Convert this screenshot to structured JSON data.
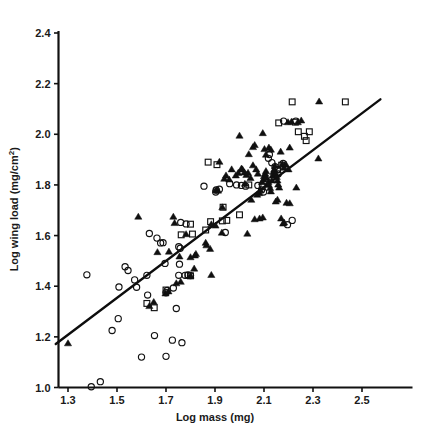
{
  "chart_data": {
    "type": "scatter",
    "title": "",
    "xlabel": "Log mass (mg)",
    "ylabel_main": "Log wing load (mg/cm",
    "ylabel_sup": "2",
    "ylabel_tail": ")",
    "ylabel_full": "Log wing load (mg/cm2)",
    "xlim": [
      1.25,
      2.58
    ],
    "ylim": [
      1.0,
      2.4
    ],
    "xticks": [
      "1.3",
      "1.5",
      "1.7",
      "1.9",
      "2.1",
      "2.3",
      "2.5"
    ],
    "xtick_values": [
      1.3,
      1.5,
      1.7,
      1.9,
      2.1,
      2.3,
      2.5
    ],
    "yticks": [
      "1.0",
      "1.2",
      "1.4",
      "1.6",
      "1.8",
      "2.0",
      "2.2",
      "2.4"
    ],
    "ytick_values": [
      1.0,
      1.2,
      1.4,
      1.6,
      1.8,
      2.0,
      2.2,
      2.4
    ],
    "grid": false,
    "legend": "none",
    "marker_colors": {
      "open_circle": "#121212",
      "open_square": "#121212",
      "filled_triangle": "#101010",
      "fit_line": "#0d0d0d"
    },
    "fit_line": {
      "x_start": 1.25,
      "y_start": 1.172,
      "x_end": 2.575,
      "y_end": 2.138,
      "slope": 0.744
    },
    "series": [
      {
        "name": "open circle",
        "marker": "open-circle",
        "points": [
          [
            1.395,
            1.003
          ],
          [
            1.432,
            1.023
          ],
          [
            1.6,
            1.12
          ],
          [
            1.7,
            1.123
          ],
          [
            1.653,
            1.205
          ],
          [
            1.726,
            1.187
          ],
          [
            1.765,
            1.177
          ],
          [
            1.48,
            1.225
          ],
          [
            1.505,
            1.272
          ],
          [
            1.533,
            1.477
          ],
          [
            1.545,
            1.462
          ],
          [
            1.572,
            1.425
          ],
          [
            1.58,
            1.396
          ],
          [
            1.508,
            1.397
          ],
          [
            1.377,
            1.445
          ],
          [
            1.622,
            1.443
          ],
          [
            1.625,
            1.365
          ],
          [
            1.752,
            1.443
          ],
          [
            1.778,
            1.443
          ],
          [
            1.7,
            1.374
          ],
          [
            1.705,
            1.383
          ],
          [
            1.73,
            1.393
          ],
          [
            1.742,
            1.312
          ],
          [
            1.696,
            1.49
          ],
          [
            1.755,
            1.487
          ],
          [
            1.632,
            1.608
          ],
          [
            1.663,
            1.59
          ],
          [
            1.678,
            1.571
          ],
          [
            1.688,
            1.572
          ],
          [
            1.752,
            1.556
          ],
          [
            1.758,
            1.55
          ],
          [
            1.79,
            1.445
          ],
          [
            1.8,
            1.442
          ],
          [
            1.782,
            1.646
          ],
          [
            1.76,
            1.652
          ],
          [
            1.855,
            1.795
          ],
          [
            1.905,
            1.78
          ],
          [
            1.918,
            1.783
          ],
          [
            1.96,
            1.805
          ],
          [
            1.942,
            1.612
          ],
          [
            1.988,
            1.8
          ],
          [
            2.008,
            1.798
          ],
          [
            2.025,
            1.795
          ],
          [
            2.075,
            1.798
          ],
          [
            2.09,
            1.78
          ],
          [
            2.098,
            1.772
          ],
          [
            2.118,
            1.905
          ],
          [
            2.122,
            1.92
          ],
          [
            2.132,
            1.888
          ],
          [
            2.145,
            1.872
          ],
          [
            2.155,
            1.86
          ],
          [
            2.158,
            1.843
          ],
          [
            2.178,
            1.885
          ],
          [
            2.18,
            2.052
          ],
          [
            2.23,
            2.052
          ],
          [
            2.196,
            1.643
          ],
          [
            2.215,
            1.66
          ],
          [
            1.903,
            1.772
          ]
        ]
      },
      {
        "name": "open square",
        "marker": "open-square",
        "points": [
          [
            1.622,
            1.332
          ],
          [
            1.652,
            1.315
          ],
          [
            1.7,
            1.385
          ],
          [
            1.762,
            1.603
          ],
          [
            1.79,
            1.443
          ],
          [
            1.8,
            1.441
          ],
          [
            1.8,
            1.645
          ],
          [
            1.808,
            1.606
          ],
          [
            1.862,
            1.622
          ],
          [
            1.872,
            1.89
          ],
          [
            1.908,
            1.88
          ],
          [
            1.882,
            1.655
          ],
          [
            1.93,
            1.658
          ],
          [
            1.933,
            1.712
          ],
          [
            1.948,
            1.66
          ],
          [
            2.0,
            1.682
          ],
          [
            2.038,
            1.8
          ],
          [
            2.155,
            1.86
          ],
          [
            2.172,
            1.878
          ],
          [
            2.215,
            2.128
          ],
          [
            2.228,
            2.048
          ],
          [
            2.24,
            2.01
          ],
          [
            2.265,
            1.992
          ],
          [
            2.272,
            1.975
          ],
          [
            2.285,
            2.01
          ],
          [
            2.432,
            2.128
          ],
          [
            2.16,
            2.045
          ],
          [
            2.093,
            1.793
          ]
        ]
      },
      {
        "name": "filled triangle",
        "marker": "filled-triangle",
        "points": [
          [
            1.3,
            1.175
          ],
          [
            1.632,
            1.322
          ],
          [
            1.65,
            1.338
          ],
          [
            1.698,
            1.372
          ],
          [
            1.71,
            1.38
          ],
          [
            1.742,
            1.412
          ],
          [
            1.76,
            1.418
          ],
          [
            1.8,
            1.442
          ],
          [
            1.815,
            1.47
          ],
          [
            1.818,
            1.522
          ],
          [
            1.822,
            1.528
          ],
          [
            1.8,
            1.515
          ],
          [
            1.665,
            1.535
          ],
          [
            1.712,
            1.537
          ],
          [
            1.755,
            1.518
          ],
          [
            1.782,
            1.606
          ],
          [
            1.735,
            1.65
          ],
          [
            1.587,
            1.675
          ],
          [
            1.73,
            1.675
          ],
          [
            1.862,
            1.572
          ],
          [
            1.865,
            1.562
          ],
          [
            1.88,
            1.548
          ],
          [
            1.905,
            1.78
          ],
          [
            1.912,
            1.778
          ],
          [
            1.93,
            1.712
          ],
          [
            1.885,
            1.645
          ],
          [
            1.902,
            1.64
          ],
          [
            1.928,
            1.612
          ],
          [
            1.885,
            1.445
          ],
          [
            1.918,
            1.892
          ],
          [
            2.0,
            1.995
          ],
          [
            2.012,
            1.862
          ],
          [
            2.02,
            1.85
          ],
          [
            2.028,
            1.84
          ],
          [
            2.035,
            1.848
          ],
          [
            2.045,
            1.828
          ],
          [
            2.022,
            1.805
          ],
          [
            2.055,
            1.878
          ],
          [
            2.068,
            1.862
          ],
          [
            2.075,
            1.845
          ],
          [
            2.08,
            1.768
          ],
          [
            2.085,
            1.78
          ],
          [
            2.092,
            1.812
          ],
          [
            2.098,
            1.822
          ],
          [
            2.1,
            1.835
          ],
          [
            2.105,
            1.845
          ],
          [
            2.108,
            1.855
          ],
          [
            2.112,
            1.828
          ],
          [
            2.118,
            1.812
          ],
          [
            2.12,
            1.8
          ],
          [
            2.125,
            1.788
          ],
          [
            2.128,
            1.775
          ],
          [
            2.132,
            1.818
          ],
          [
            2.135,
            1.838
          ],
          [
            2.138,
            1.852
          ],
          [
            2.142,
            1.862
          ],
          [
            2.145,
            1.875
          ],
          [
            2.148,
            1.845
          ],
          [
            2.152,
            1.832
          ],
          [
            2.155,
            1.818
          ],
          [
            2.158,
            1.802
          ],
          [
            2.162,
            1.79
          ],
          [
            2.12,
            1.948
          ],
          [
            2.128,
            1.94
          ],
          [
            2.108,
            1.92
          ],
          [
            2.095,
            2.005
          ],
          [
            2.102,
            1.942
          ],
          [
            2.168,
            1.932
          ],
          [
            2.175,
            1.882
          ],
          [
            2.182,
            1.868
          ],
          [
            2.19,
            1.88
          ],
          [
            2.2,
            1.862
          ],
          [
            2.205,
            1.948
          ],
          [
            2.082,
            1.668
          ],
          [
            2.095,
            1.672
          ],
          [
            2.032,
            1.608
          ],
          [
            2.062,
            1.665
          ],
          [
            2.17,
            1.668
          ],
          [
            2.178,
            1.648
          ],
          [
            2.182,
            1.652
          ],
          [
            2.192,
            1.73
          ],
          [
            2.205,
            1.728
          ],
          [
            2.148,
            1.735
          ],
          [
            2.155,
            1.742
          ],
          [
            2.048,
            1.742
          ],
          [
            2.072,
            1.762
          ],
          [
            2.232,
            1.79
          ],
          [
            2.322,
            1.905
          ],
          [
            2.325,
            2.13
          ],
          [
            2.198,
            2.048
          ],
          [
            2.212,
            2.05
          ],
          [
            2.238,
            2.048
          ],
          [
            2.252,
            2.055
          ],
          [
            2.038,
            1.922
          ],
          [
            2.055,
            1.95
          ],
          [
            2.062,
            1.958
          ],
          [
            2.008,
            1.865
          ],
          [
            1.968,
            1.862
          ],
          [
            1.985,
            1.838
          ],
          [
            1.995,
            1.848
          ],
          [
            1.958,
            1.822
          ],
          [
            1.945,
            1.838
          ],
          [
            1.938,
            1.825
          ]
        ]
      }
    ],
    "counts": {
      "open_circle": 58,
      "open_square": 28,
      "filled_triangle": 102
    }
  }
}
